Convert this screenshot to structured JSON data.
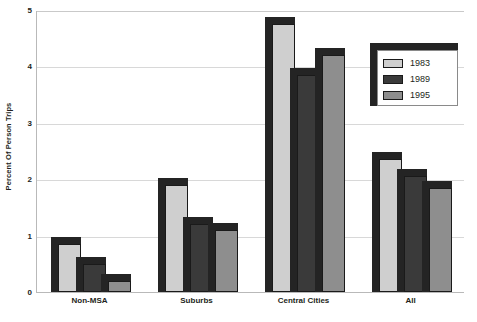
{
  "chart_data": {
    "type": "bar",
    "title": "",
    "xlabel": "",
    "ylabel": "Percent Of Person Trips",
    "categories": [
      "Non-MSA",
      "Suburbs",
      "Central Cities",
      "All"
    ],
    "series": [
      {
        "name": "1983",
        "color": "#cfcfcf",
        "values": [
          0.85,
          1.9,
          4.75,
          2.35
        ]
      },
      {
        "name": "1989",
        "color": "#3a3a3a",
        "values": [
          0.5,
          1.2,
          3.85,
          2.05
        ]
      },
      {
        "name": "1995",
        "color": "#8e8e8e",
        "values": [
          0.2,
          1.1,
          4.2,
          1.85
        ]
      }
    ],
    "ylim": [
      0,
      5
    ],
    "yticks": [
      0,
      1,
      2,
      3,
      4,
      5
    ],
    "ytick_labels": [
      "0",
      "1",
      "2",
      "3",
      "4",
      "5"
    ],
    "grid": true,
    "legend_position": "top-right",
    "style": "3d-bar"
  }
}
